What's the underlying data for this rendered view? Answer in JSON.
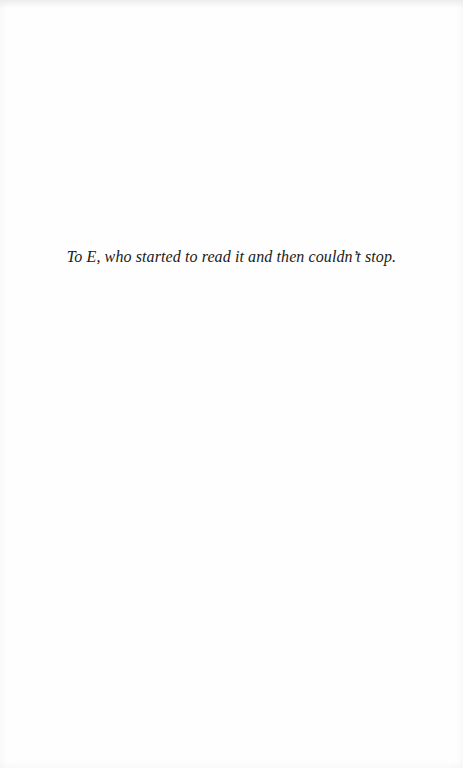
{
  "page": {
    "type": "dedication",
    "background_color": "#fefefe",
    "text_color": "#1a1a1a"
  },
  "dedication": {
    "text": "To E, who started to read it and then couldn’t stop."
  }
}
